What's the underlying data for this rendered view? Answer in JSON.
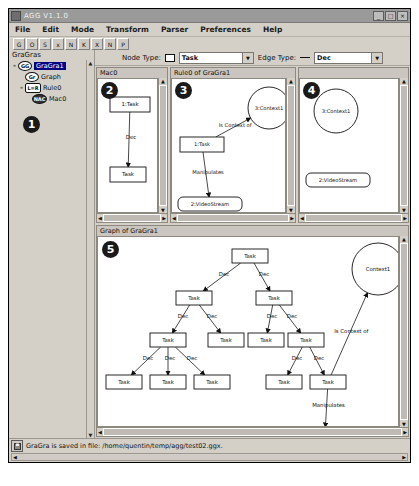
{
  "window": {
    "title": "AGG V1.1.0",
    "buttons": {
      "minimize": "_",
      "maximize": "□",
      "close": "×"
    }
  },
  "menubar": {
    "items": [
      {
        "label": "File"
      },
      {
        "label": "Edit"
      },
      {
        "label": "Mode"
      },
      {
        "label": "Transform"
      },
      {
        "label": "Parser"
      },
      {
        "label": "Preferences"
      },
      {
        "label": "Help"
      }
    ]
  },
  "toolbar_row1": {
    "buttons": [
      {
        "name": "new-gragra-icon",
        "glyph": "G"
      },
      {
        "name": "open-icon",
        "glyph": "O"
      },
      {
        "name": "save-icon",
        "glyph": "S"
      },
      {
        "name": "stop-icon",
        "glyph": "x"
      },
      {
        "name": "step-icon",
        "glyph": "N"
      },
      {
        "name": "cut-icon",
        "glyph": "K"
      },
      {
        "name": "delete-icon",
        "glyph": "X"
      },
      {
        "name": "apply-rule-icon",
        "glyph": "N"
      },
      {
        "name": "print-icon",
        "glyph": "P"
      }
    ]
  },
  "toolbar_row2": {
    "buttons": [
      {
        "name": "new-rule-icon",
        "glyph": "N"
      },
      {
        "name": "copy-rule-icon",
        "glyph": "R"
      },
      {
        "name": "paste-rule-icon",
        "glyph": "C"
      },
      {
        "name": "nac-icon",
        "glyph": "Y"
      },
      {
        "name": "nac2-icon",
        "glyph": "Y"
      },
      {
        "name": "match-icon",
        "glyph": "Y"
      },
      {
        "name": "match2-icon",
        "glyph": "Y"
      },
      {
        "name": "is-icon",
        "glyph": "IS"
      },
      {
        "name": "in-icon",
        "glyph": "IN"
      },
      {
        "name": "select-icon",
        "glyph": "S"
      },
      {
        "name": "arrow-icon",
        "glyph": "A"
      },
      {
        "name": "edge-tool-icon",
        "glyph": "E"
      },
      {
        "name": "attribute-icon",
        "glyph": "A"
      },
      {
        "name": "zoom-in-icon",
        "glyph": "+"
      },
      {
        "name": "zoom-out-icon",
        "glyph": "-"
      },
      {
        "name": "move-icon",
        "glyph": "M"
      },
      {
        "name": "grid-icon",
        "glyph": "G"
      },
      {
        "name": "morph-icon",
        "glyph": "D"
      },
      {
        "name": "cursor-icon",
        "glyph": "S"
      },
      {
        "name": "check-icon",
        "glyph": "✓"
      }
    ]
  },
  "tree": {
    "header": "GraGras",
    "nodes": [
      {
        "handle": "o-",
        "badge": "GG",
        "badge_kind": "round",
        "label": "GraGra1",
        "selected": true,
        "indent": 0
      },
      {
        "handle": "",
        "badge": "Gr",
        "badge_kind": "round",
        "label": "Graph",
        "selected": false,
        "indent": 1
      },
      {
        "handle": "o-",
        "badge": "L=R",
        "badge_kind": "square",
        "label": "Rule0",
        "selected": false,
        "indent": 1
      },
      {
        "handle": "",
        "badge": "NAC",
        "badge_kind": "mac",
        "label": "Mac0",
        "selected": false,
        "indent": 2
      }
    ]
  },
  "typebar": {
    "node_type_label": "Node Type:",
    "node_type_value": "Task",
    "edge_type_label": "Edge Type:",
    "edge_type_value": "Dec"
  },
  "callouts": {
    "one": "1",
    "two": "2",
    "three": "3",
    "four": "4",
    "five": "5"
  },
  "panels": {
    "nac": {
      "title": "Mac0",
      "nodes": [
        {
          "id": "n1",
          "label": "1:Task",
          "shape": "rect",
          "x": 12,
          "y": 18,
          "w": 40,
          "h": 15
        },
        {
          "id": "n2",
          "label": "Task",
          "shape": "rect",
          "x": 12,
          "y": 88,
          "w": 36,
          "h": 15
        }
      ],
      "edges": [
        {
          "from": "n1",
          "to": "n2",
          "label": "Dec"
        }
      ]
    },
    "lhs": {
      "title": "Rule0 of GraGra1",
      "nodes": [
        {
          "id": "t1",
          "label": "1:Task",
          "shape": "rect",
          "x": 8,
          "y": 58,
          "w": 44,
          "h": 15
        },
        {
          "id": "c1",
          "label": "3:Context1",
          "shape": "circle",
          "x": 76,
          "y": 8,
          "w": 42,
          "h": 42
        },
        {
          "id": "v1",
          "label": "2:VideoStream",
          "shape": "round",
          "x": 6,
          "y": 118,
          "w": 64,
          "h": 14
        }
      ],
      "edges": [
        {
          "from": "t1",
          "to": "c1",
          "label": "Is Context of"
        },
        {
          "from": "t1",
          "to": "v1",
          "label": "Manipulates"
        }
      ]
    },
    "rhs": {
      "title": "",
      "nodes": [
        {
          "id": "c1",
          "label": "3:Context1",
          "shape": "circle",
          "x": 14,
          "y": 10,
          "w": 44,
          "h": 44
        },
        {
          "id": "v1",
          "label": "2:VideoStream",
          "shape": "round",
          "x": 6,
          "y": 94,
          "w": 64,
          "h": 14
        }
      ],
      "edges": []
    },
    "graph": {
      "title": "Graph of GraGra1",
      "nodes": [
        {
          "id": "g0",
          "label": "Task",
          "shape": "rect",
          "x": 134,
          "y": 12,
          "w": 36,
          "h": 14
        },
        {
          "id": "g1",
          "label": "Task",
          "shape": "rect",
          "x": 78,
          "y": 54,
          "w": 36,
          "h": 14
        },
        {
          "id": "g2",
          "label": "Task",
          "shape": "rect",
          "x": 158,
          "y": 54,
          "w": 36,
          "h": 14
        },
        {
          "id": "g3",
          "label": "Task",
          "shape": "rect",
          "x": 52,
          "y": 96,
          "w": 36,
          "h": 14
        },
        {
          "id": "g4",
          "label": "Task",
          "shape": "rect",
          "x": 110,
          "y": 96,
          "w": 36,
          "h": 14
        },
        {
          "id": "g5",
          "label": "Task",
          "shape": "rect",
          "x": 150,
          "y": 96,
          "w": 36,
          "h": 14
        },
        {
          "id": "g6",
          "label": "Task",
          "shape": "rect",
          "x": 190,
          "y": 96,
          "w": 36,
          "h": 14
        },
        {
          "id": "g7",
          "label": "Task",
          "shape": "rect",
          "x": 8,
          "y": 138,
          "w": 36,
          "h": 14
        },
        {
          "id": "g8",
          "label": "Task",
          "shape": "rect",
          "x": 52,
          "y": 138,
          "w": 36,
          "h": 14
        },
        {
          "id": "g9",
          "label": "Task",
          "shape": "rect",
          "x": 96,
          "y": 138,
          "w": 36,
          "h": 14
        },
        {
          "id": "g10",
          "label": "Task",
          "shape": "rect",
          "x": 168,
          "y": 138,
          "w": 36,
          "h": 14
        },
        {
          "id": "g11",
          "label": "Task",
          "shape": "rect",
          "x": 212,
          "y": 138,
          "w": 36,
          "h": 14
        },
        {
          "id": "ctx",
          "label": "Context1",
          "shape": "circle",
          "x": 254,
          "y": 6,
          "w": 52,
          "h": 52
        },
        {
          "id": "vid",
          "label": "VideoStream",
          "shape": "round",
          "x": 196,
          "y": 190,
          "w": 62,
          "h": 14
        }
      ],
      "edges": [
        {
          "from": "g0",
          "to": "g1",
          "label": "Dec"
        },
        {
          "from": "g0",
          "to": "g2",
          "label": "Dec"
        },
        {
          "from": "g1",
          "to": "g3",
          "label": "Dec"
        },
        {
          "from": "g1",
          "to": "g4",
          "label": "Dec"
        },
        {
          "from": "g2",
          "to": "g5",
          "label": "Dec"
        },
        {
          "from": "g2",
          "to": "g6",
          "label": "Dec"
        },
        {
          "from": "g3",
          "to": "g7",
          "label": "Dec"
        },
        {
          "from": "g3",
          "to": "g8",
          "label": "Dec"
        },
        {
          "from": "g3",
          "to": "g9",
          "label": "Dec"
        },
        {
          "from": "g6",
          "to": "g10",
          "label": "Dec"
        },
        {
          "from": "g6",
          "to": "g11",
          "label": "Dec"
        },
        {
          "from": "g11",
          "to": "vid",
          "label": "Manipulates"
        },
        {
          "from": "g11",
          "to": "ctx",
          "label": "Is Context of"
        }
      ]
    }
  },
  "status": {
    "message": "GraGra is saved in file: /home/quentin/temp/agg/test02.ggx."
  },
  "colors": {
    "face": "#d4d0c8",
    "canvas": "#ffffff",
    "selection": "#000080",
    "text": "#111111"
  }
}
